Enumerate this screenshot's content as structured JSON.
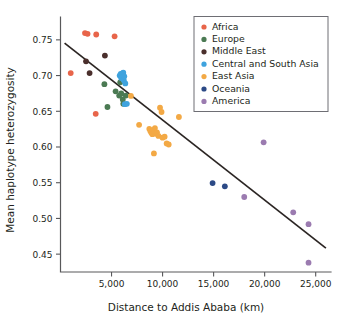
{
  "chart_data": {
    "type": "scatter",
    "title": "",
    "xlabel": "Distance to Addis Ababa (km)",
    "ylabel": "Mean haplotype heterozygosity",
    "xlim": [
      0,
      26500
    ],
    "ylim": [
      0.425,
      0.775
    ],
    "xticks": [
      5000,
      10000,
      15000,
      20000,
      25000
    ],
    "xticklabels": [
      "5,000",
      "10,000",
      "15,000",
      "20,000",
      "25,000"
    ],
    "yticks": [
      0.45,
      0.5,
      0.55,
      0.6,
      0.65,
      0.7,
      0.75
    ],
    "yticklabels": [
      "0.45",
      "0.50",
      "0.55",
      "0.60",
      "0.65",
      "0.70",
      "0.75"
    ],
    "grid": false,
    "legend_position": "top-right",
    "trendline": {
      "name": "linear-fit",
      "color": "#2b2523",
      "x_start": 400,
      "y_start": 0.7455,
      "x_end": 26000,
      "y_end": 0.4585
    },
    "series": [
      {
        "name": "Africa",
        "color": "#e8654a",
        "points": [
          [
            1000,
            0.7035
          ],
          [
            2400,
            0.7595
          ],
          [
            2650,
            0.7585
          ],
          [
            3500,
            0.7575
          ],
          [
            3450,
            0.6465
          ],
          [
            5300,
            0.755
          ]
        ]
      },
      {
        "name": "Europe",
        "color": "#4b7a53",
        "points": [
          [
            4300,
            0.688
          ],
          [
            4600,
            0.656
          ],
          [
            5400,
            0.678
          ],
          [
            5750,
            0.672
          ],
          [
            5850,
            0.6905
          ],
          [
            6100,
            0.6665
          ],
          [
            6150,
            0.6605
          ],
          [
            6400,
            0.672
          ],
          [
            5950,
            0.675
          ]
        ]
      },
      {
        "name": "Middle East",
        "color": "#4a2f2c",
        "points": [
          [
            2500,
            0.72
          ],
          [
            2850,
            0.7035
          ],
          [
            4350,
            0.728
          ]
        ]
      },
      {
        "name": "Central and South Asia",
        "color": "#3fa3de",
        "points": [
          [
            5800,
            0.7
          ],
          [
            5900,
            0.7025
          ],
          [
            5950,
            0.6965
          ],
          [
            6050,
            0.703
          ],
          [
            6100,
            0.698
          ],
          [
            6150,
            0.704
          ],
          [
            6200,
            0.6935
          ],
          [
            6250,
            0.699
          ],
          [
            6350,
            0.689
          ],
          [
            6300,
            0.66
          ],
          [
            6500,
            0.6605
          ]
        ]
      },
      {
        "name": "East Asia",
        "color": "#f3a945",
        "points": [
          [
            6900,
            0.6715
          ],
          [
            7700,
            0.631
          ],
          [
            8700,
            0.6255
          ],
          [
            8800,
            0.6225
          ],
          [
            8900,
            0.62
          ],
          [
            9000,
            0.618
          ],
          [
            9100,
            0.624
          ],
          [
            9200,
            0.6215
          ],
          [
            9250,
            0.6265
          ],
          [
            9350,
            0.6185
          ],
          [
            9450,
            0.6205
          ],
          [
            9600,
            0.6155
          ],
          [
            9750,
            0.655
          ],
          [
            9900,
            0.649
          ],
          [
            10000,
            0.613
          ],
          [
            10200,
            0.6145
          ],
          [
            10400,
            0.605
          ],
          [
            10600,
            0.6035
          ],
          [
            9150,
            0.591
          ],
          [
            11600,
            0.642
          ]
        ]
      },
      {
        "name": "Oceania",
        "color": "#2c4a86",
        "points": [
          [
            14900,
            0.5495
          ],
          [
            16100,
            0.545
          ]
        ]
      },
      {
        "name": "America",
        "color": "#9b7bb0",
        "points": [
          [
            18000,
            0.53
          ],
          [
            19900,
            0.6065
          ],
          [
            22800,
            0.5085
          ],
          [
            24300,
            0.492
          ],
          [
            24300,
            0.438
          ]
        ]
      }
    ]
  },
  "legend": {
    "entries": [
      {
        "label": "Africa",
        "color": "#e8654a"
      },
      {
        "label": "Europe",
        "color": "#4b7a53"
      },
      {
        "label": "Middle East",
        "color": "#4a2f2c"
      },
      {
        "label": "Central and South Asia",
        "color": "#3fa3de"
      },
      {
        "label": "East Asia",
        "color": "#f3a945"
      },
      {
        "label": "Oceania",
        "color": "#2c4a86"
      },
      {
        "label": "America",
        "color": "#9b7bb0"
      }
    ]
  }
}
